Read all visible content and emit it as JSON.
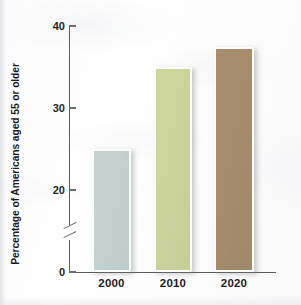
{
  "chart_data": {
    "type": "bar",
    "title": "",
    "subtitle": "",
    "xlabel": "",
    "ylabel": "Percentage of Americans aged 55 or older",
    "categories": [
      "2000",
      "2010",
      "2020"
    ],
    "values": [
      25,
      35,
      37.5
    ],
    "series": [
      {
        "name": "Percentage of Americans aged 55 or older",
        "values": [
          25,
          35,
          37.5
        ]
      }
    ],
    "ytick_labels": [
      "0",
      "20",
      "30",
      "40"
    ],
    "ytick_values": [
      0,
      20,
      30,
      40
    ],
    "ylim": [
      0,
      40
    ],
    "axis_break": true,
    "axis_break_between": [
      0,
      20
    ],
    "grid": false,
    "legend": false,
    "legend_position": "none",
    "bar_colors": [
      "#c3d3d1",
      "#cdd49c",
      "#a68d6e"
    ],
    "bar_border_color": "#fdfdfc",
    "axis_color": "#595b5e"
  },
  "figure": {
    "background_color": "#fdfdfd",
    "axis_label_color": "#1b1b1b"
  }
}
